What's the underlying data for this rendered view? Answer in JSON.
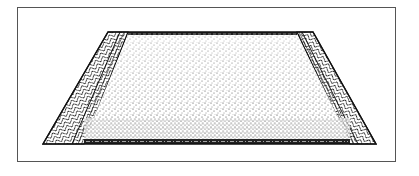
{
  "figure": {
    "caption": "",
    "colors": {
      "ink": "#111111",
      "paper": "#ffffff",
      "frame": "#555555"
    },
    "rug": {
      "outer": [
        [
          108,
          32
        ],
        [
          313,
          32
        ],
        [
          376,
          144
        ],
        [
          43,
          144
        ]
      ],
      "field": [
        [
          128,
          34
        ],
        [
          297,
          34
        ],
        [
          350,
          142
        ],
        [
          84,
          142
        ]
      ],
      "border_pattern": "herringbone",
      "field_pattern": "stipple"
    }
  }
}
